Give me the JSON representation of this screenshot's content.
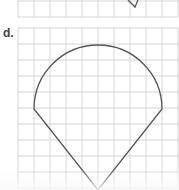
{
  "figure": {
    "label": "d.",
    "grid": {
      "columns": 10,
      "cell_px": 16,
      "line_color": "#d4d4d4"
    },
    "shape": {
      "description": "semicircle arc on top joined to a downward-pointing V (ice-cream cone / teardrop shape)",
      "stroke_color": "#555555"
    },
    "previous_figure": {
      "description": "partial grid with a bottom tip of a shape"
    }
  }
}
